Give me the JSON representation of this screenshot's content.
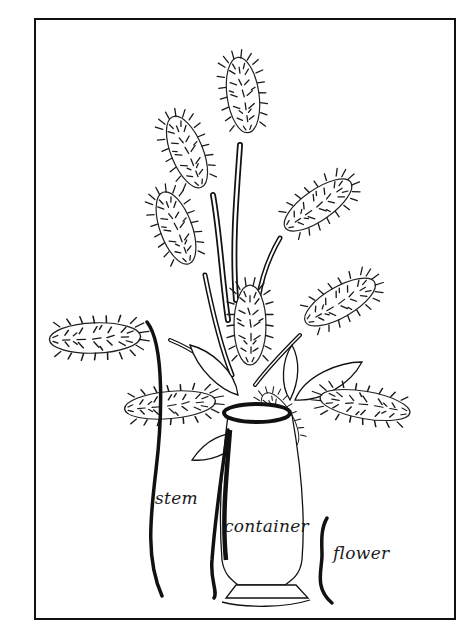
{
  "figure": {
    "ink_color": "#111111",
    "background_color": "#ffffff"
  },
  "labels": {
    "stem": "stem",
    "container": "container",
    "flower": "flower"
  }
}
